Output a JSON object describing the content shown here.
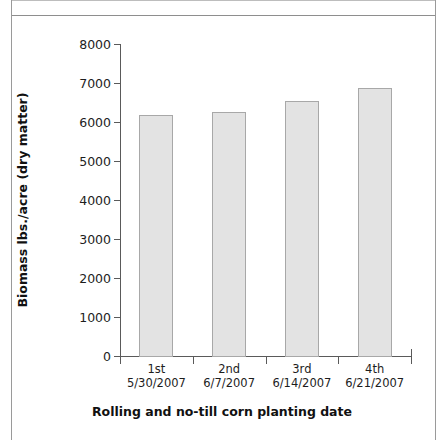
{
  "chart_data": {
    "type": "bar",
    "title": "",
    "subtitle": "",
    "xlabel": "Rolling and no-till corn planting date",
    "ylabel": "Biomass lbs./acre (dry matter)",
    "categories": [
      "1st",
      "2nd",
      "3rd",
      "4th"
    ],
    "category_sublabels": [
      "5/30/2007",
      "6/7/2007",
      "6/14/2007",
      "6/21/2007"
    ],
    "values": [
      6180,
      6250,
      6540,
      6880
    ],
    "ylim": [
      0,
      8000
    ],
    "yticks": [
      0,
      1000,
      2000,
      3000,
      4000,
      5000,
      6000,
      7000,
      8000
    ],
    "ytick_labels": [
      "0",
      "1000",
      "2000",
      "3000",
      "4000",
      "5000",
      "6000",
      "7000",
      "8000"
    ],
    "grid": false,
    "legend": null,
    "legend_position": "none",
    "bar_fill_color": "#e3e3e3",
    "bar_border_color": "#a8a8a8",
    "axis_color": "#5a5a5a",
    "text_color": "#1d1d1d"
  }
}
